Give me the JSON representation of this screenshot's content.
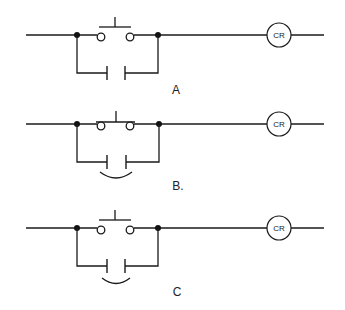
{
  "figure": {
    "circuits": [
      {
        "id": "A",
        "label": "A",
        "coil_label": "CR",
        "pushbutton": "normally-open push button",
        "holding_contact": "normally-open contact",
        "mechanical_link": false,
        "button_bar_touching": false
      },
      {
        "id": "B",
        "label": "B.",
        "coil_label": "CR",
        "pushbutton": "normally-open push button (bar on contacts)",
        "holding_contact": "normally-open contact with arc link",
        "mechanical_link": true,
        "button_bar_touching": true
      },
      {
        "id": "C",
        "label": "C",
        "coil_label": "CR",
        "pushbutton": "normally-open push button",
        "holding_contact": "normally-open contact with arc link",
        "mechanical_link": true,
        "button_bar_touching": false
      }
    ]
  },
  "colors": {
    "line": "#1a1a1a",
    "background": "#ffffff"
  }
}
